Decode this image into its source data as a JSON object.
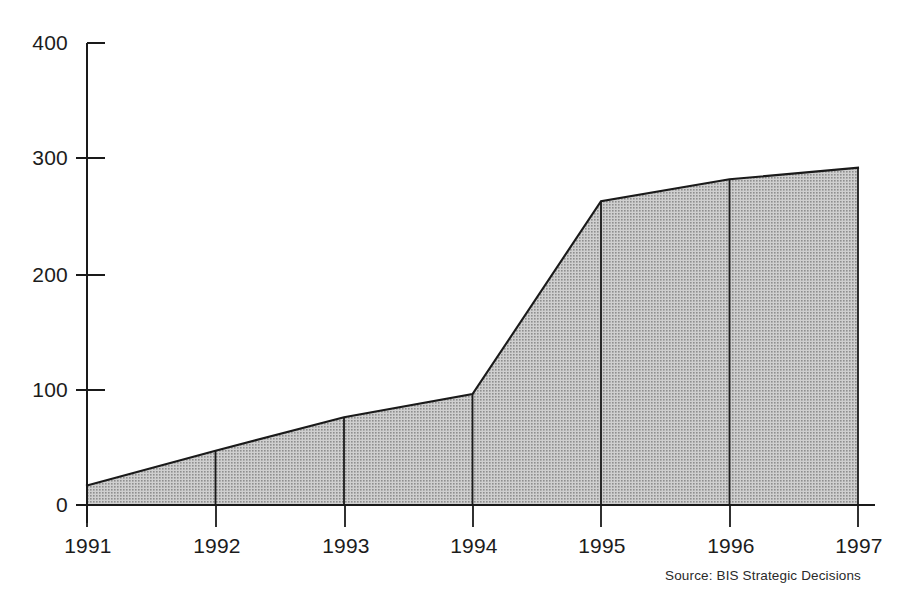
{
  "chart_data": {
    "type": "area",
    "title": "",
    "subtitle": "",
    "xlabel": "",
    "ylabel": "",
    "categories": [
      "1991",
      "1992",
      "1993",
      "1994",
      "1995",
      "1996",
      "1997"
    ],
    "values": [
      17,
      47,
      76,
      96,
      263,
      282,
      292
    ],
    "series": [
      {
        "name": "",
        "values": [
          17,
          47,
          76,
          96,
          263,
          282,
          292
        ]
      }
    ],
    "xlim": [
      "1991",
      "1997"
    ],
    "ylim": [
      0,
      400
    ],
    "yticks": [
      0,
      100,
      200,
      300,
      400
    ],
    "ytick_labels": [
      "0",
      "100",
      "200",
      "300",
      "400"
    ],
    "xtick_labels": [
      "1991",
      "1992",
      "1993",
      "1994",
      "1995",
      "1996",
      "1997"
    ],
    "grid": false,
    "legend": false,
    "legend_position": "none",
    "annotations": [],
    "source_note": "Source:  BIS Strategic Decisions",
    "colors": {
      "fill": "#b2b2b2",
      "line": "#1a1a1a",
      "axis": "#1a1a1a",
      "text": "#1c1c1c",
      "background": "#ffffff"
    }
  }
}
